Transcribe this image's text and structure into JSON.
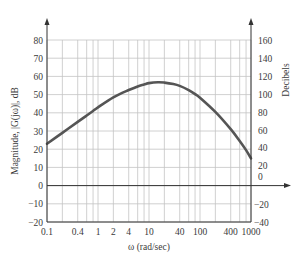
{
  "chart_data": {
    "type": "line",
    "title": "",
    "xlabel": "ω (rad/sec)",
    "ylabel": "Magnitude, |G(jω)|, dB",
    "y2label": "Decibels",
    "xscale": "log",
    "xlim": [
      0.1,
      1000
    ],
    "ylim": [
      -20,
      80
    ],
    "y2lim": [
      -40,
      160
    ],
    "grid": true,
    "x_tick_labels": [
      "0.1",
      "0.4",
      "1",
      "2",
      "4",
      "10",
      "40",
      "100",
      "400",
      "1000"
    ],
    "x_tick_values": [
      0.1,
      0.4,
      1,
      2,
      4,
      10,
      40,
      100,
      400,
      1000
    ],
    "x_grid_values": [
      0.1,
      0.2,
      0.4,
      0.6,
      0.8,
      1,
      2,
      4,
      6,
      8,
      10,
      20,
      40,
      60,
      80,
      100,
      200,
      400,
      600,
      800,
      1000
    ],
    "y_tick_labels": [
      "80",
      "70",
      "60",
      "50",
      "40",
      "30",
      "20",
      "10",
      "0",
      "−10",
      "−20"
    ],
    "y_tick_values": [
      80,
      70,
      60,
      50,
      40,
      30,
      20,
      10,
      0,
      -10,
      -20
    ],
    "y2_tick_labels": [
      "160",
      "140",
      "120",
      "100",
      "80",
      "60",
      "40",
      "20",
      "0",
      "−20",
      "−40"
    ],
    "series": [
      {
        "name": "|G(jω)| dB",
        "color": "#555555",
        "x": [
          0.1,
          0.2,
          0.4,
          0.6,
          0.8,
          1,
          2,
          4,
          6,
          8,
          10,
          15,
          20,
          30,
          40,
          60,
          80,
          100,
          200,
          400,
          600,
          800,
          1000
        ],
        "values": [
          23,
          29,
          35,
          38.5,
          41,
          43,
          48.5,
          52.5,
          54.5,
          55.5,
          56.3,
          56.8,
          56.6,
          55.8,
          54.8,
          52.5,
          50.3,
          48.3,
          40.5,
          31,
          24.5,
          19.5,
          15
        ]
      }
    ]
  },
  "labels": {
    "ylabel": "Magnitude, |G(jω)|, dB",
    "y2label": "Decibels",
    "xlabel": "ω (rad/sec)"
  }
}
